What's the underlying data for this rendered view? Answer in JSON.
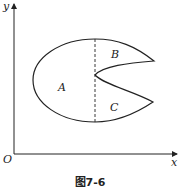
{
  "figure": {
    "caption": "图7-6",
    "axes": {
      "origin_label": "O",
      "x_label": "x",
      "y_label": "y"
    },
    "regions": [
      {
        "id": "A",
        "label": "A"
      },
      {
        "id": "B",
        "label": "B"
      },
      {
        "id": "C",
        "label": "C"
      }
    ],
    "divider": "dashed vertical line",
    "colors": {
      "stroke": "#222222",
      "background": "#ffffff"
    }
  }
}
